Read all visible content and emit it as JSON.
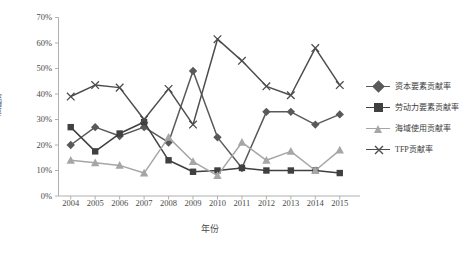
{
  "chart_data": {
    "type": "line",
    "title": "",
    "xlabel": "年份",
    "ylabel": "贡献率",
    "categories": [
      "2004",
      "2005",
      "2006",
      "2007",
      "2008",
      "2009",
      "2010",
      "2011",
      "2012",
      "2013",
      "2014",
      "2015"
    ],
    "ylim": [
      0,
      70
    ],
    "ytick_labels": [
      "0%",
      "10%",
      "20%",
      "30%",
      "40%",
      "50%",
      "60%",
      "70%"
    ],
    "ytick_values": [
      0,
      10,
      20,
      30,
      40,
      50,
      60,
      70
    ],
    "grid": false,
    "legend_position": "right",
    "series": [
      {
        "name": "资本要素贡献率",
        "marker": "diamond",
        "color": "#595959",
        "values": [
          20,
          27,
          23.5,
          27,
          21,
          49,
          23,
          11,
          33,
          33,
          28,
          32
        ]
      },
      {
        "name": "劳动力要素贡献率",
        "marker": "square",
        "color": "#404040",
        "values": [
          27,
          17.5,
          24.5,
          29,
          14,
          9.5,
          10,
          11,
          10,
          10,
          10,
          9
        ]
      },
      {
        "name": "海域使用贡献率",
        "marker": "triangle",
        "color": "#a6a6a6",
        "values": [
          14,
          13,
          12,
          9,
          23,
          13.5,
          8,
          21,
          14,
          17.5,
          10,
          18
        ]
      },
      {
        "name": "TFP贡献率",
        "marker": "cross",
        "color": "#4d4d4d",
        "values": [
          39,
          43.5,
          42.5,
          30,
          42,
          28,
          61.5,
          53,
          43,
          39.5,
          58,
          43.5
        ]
      }
    ]
  },
  "axes": {
    "y_title": "贡献率",
    "x_title": "年份"
  }
}
